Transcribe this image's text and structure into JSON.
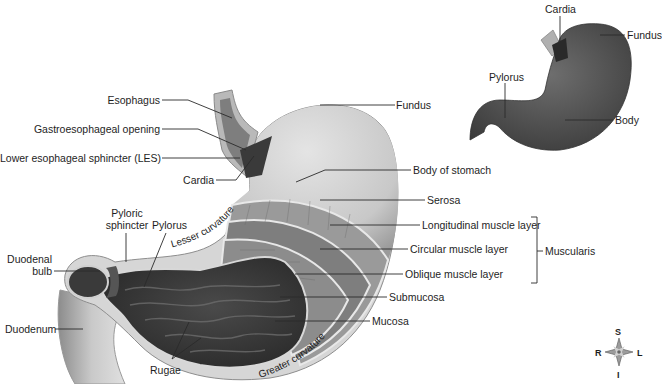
{
  "diagram": {
    "colors": {
      "background": "#ffffff",
      "label_text": "#1e1e1e",
      "leader_line": "#2a2a2a",
      "serosa": "#c9c9c9",
      "muscle_layer": "#8a8a8a",
      "mucosa_interior": "#3c3c3c",
      "small_stomach": "#5a5a5a"
    },
    "main_labels": {
      "esophagus": "Esophagus",
      "gastroesophageal_opening": "Gastroesophageal opening",
      "les": "Lower esophageal sphincter (LES)",
      "cardia": "Cardia",
      "fundus": "Fundus",
      "body_of_stomach": "Body of stomach",
      "serosa": "Serosa",
      "longitudinal": "Longitudinal muscle layer",
      "circular": "Circular muscle layer",
      "oblique": "Oblique muscle layer",
      "muscularis": "Muscularis",
      "submucosa": "Submucosa",
      "mucosa": "Mucosa",
      "pyloric_sphincter_1": "Pyloric",
      "pyloric_sphincter_2": "sphincter",
      "pylorus": "Pylorus",
      "duodenal_bulb_1": "Duodenal",
      "duodenal_bulb_2": "bulb",
      "duodenum": "Duodenum",
      "rugae": "Rugae",
      "lesser_curvature": "Lesser curvature",
      "greater_curvature": "Greater curvature"
    },
    "inset_labels": {
      "cardia": "Cardia",
      "fundus": "Fundus",
      "pylorus": "Pylorus",
      "body": "Body"
    },
    "compass": {
      "north": "S",
      "south": "I",
      "west": "R",
      "east": "L"
    }
  }
}
